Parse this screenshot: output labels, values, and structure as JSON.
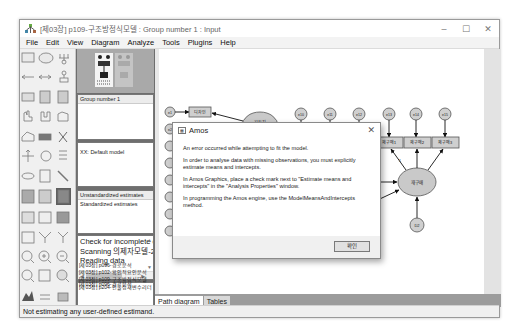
{
  "window": {
    "title": "[제03장] p109-구조방정식모델 : Group number 1 : Input",
    "controls": {
      "minimize": "–",
      "maximize": "☐",
      "close": "✕"
    }
  },
  "menu": [
    "File",
    "Edit",
    "View",
    "Diagram",
    "Analyze",
    "Tools",
    "Plugins",
    "Help"
  ],
  "toolbox": {
    "tools": [
      "draw-observed-icon",
      "draw-unobserved-icon",
      "draw-indicator-icon",
      "single-arrow-icon",
      "double-arrow-icon",
      "unique-variable-icon",
      "list-variables-model-icon",
      "list-variables-dataset-icon",
      "select-one-icon",
      "select-all-icon",
      "deselect-all-icon",
      "duplicate-icon",
      "move-icon",
      "erase-icon",
      "change-shape-icon",
      "rotate-icon",
      "reflect-icon",
      "move-parameter-icon",
      "scroll-icon",
      "touch-up-icon",
      "data-files-icon",
      "analysis-properties-icon",
      "calculate-estimates-icon",
      "copy-diagram-icon",
      "view-text-icon",
      "save-icon",
      "object-properties-icon",
      "drag-properties-icon",
      "preserve-symmetries-icon",
      "zoom-select-icon",
      "zoom-in-icon",
      "zoom-out-icon",
      "view-page-icon",
      "fit-to-page-icon",
      "loupe-icon",
      "bayesian-icon",
      "multiple-group-icon",
      "print-icon",
      "undo-icon",
      "redo-icon",
      "specification-search-icon"
    ]
  },
  "panels": {
    "groups": {
      "items": [
        "Group number 1"
      ]
    },
    "models": {
      "items": [
        "XX: Default model"
      ]
    },
    "estimates": {
      "items": [
        "Unstandardized estimates",
        "Standardized estimates"
      ]
    },
    "log": {
      "items": [
        "Check for incomplete c",
        "Scanning 의제자모델-2",
        "Reading data"
      ]
    },
    "files": {
      "items": [
        "[제03장] p096-경로분석",
        "[제03장] p102-확인적요인분석",
        "[제03장] p109-구조방정식모델",
        "[제03장] p204-인물정재변수리더"
      ]
    }
  },
  "diagram": {
    "left_errors": [
      "e1",
      "e2",
      "e3",
      "e4",
      "e5",
      "e6",
      "e7",
      "e8"
    ],
    "left_indicators": [
      "디자인",
      "자동기능"
    ],
    "latent_exogenous": "자동차\n이미지",
    "top_errors": [
      "e10",
      "e11",
      "e12",
      "e13",
      "e14",
      "e15"
    ],
    "top_indicators": [
      "",
      "",
      "",
      "재구매1",
      "재구매2",
      "재구매3"
    ],
    "latent_endogenous": "재구매",
    "disturbance": "D2",
    "path_weight": "1"
  },
  "dialog": {
    "title": "Amos",
    "close": "✕",
    "messages": [
      "An error occurred while attempting to fit the model.",
      "In order to analyse data with missing observations, you must explicitly estimate means and intercepts.",
      "In Amos Graphics, place a check mark next to \"Estimate means and intercepts\" in the \"Analysis Properties\" window.",
      "In programming the Amos engine, use the ModelMeansAndIntercepts method."
    ],
    "ok_label": "확인"
  },
  "tabs": [
    "Path diagram",
    "Tables"
  ],
  "status": "Not estimating any user-defined estimand.",
  "colors": {
    "node_fill": "#c9c9c9",
    "indicator_fill": "#cfcfcf",
    "dialog_footer": "#f0f0f0",
    "selected_tool": "#5f5f5f"
  }
}
